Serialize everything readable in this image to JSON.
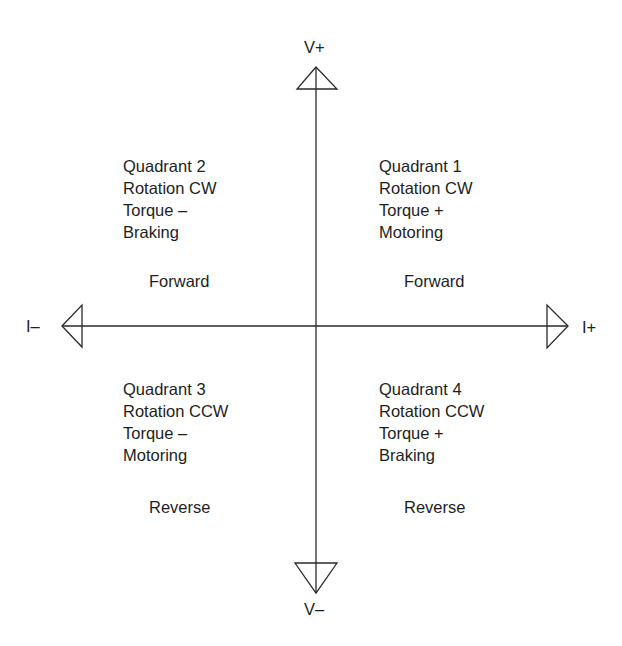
{
  "axes": {
    "vertical_positive": "V+",
    "vertical_negative": "V–",
    "horizontal_negative": "I–",
    "horizontal_positive": "I+"
  },
  "quadrants": [
    {
      "id": 1,
      "lines": [
        "Quadrant 1",
        "Rotation CW",
        "Torque +",
        "Motoring"
      ],
      "direction": "Forward"
    },
    {
      "id": 2,
      "lines": [
        "Quadrant 2",
        "Rotation CW",
        "Torque –",
        "Braking"
      ],
      "direction": "Forward"
    },
    {
      "id": 3,
      "lines": [
        "Quadrant 3",
        "Rotation CCW",
        "Torque –",
        "Motoring"
      ],
      "direction": "Reverse"
    },
    {
      "id": 4,
      "lines": [
        "Quadrant 4",
        "Rotation CCW",
        "Torque +",
        "Braking"
      ],
      "direction": "Reverse"
    }
  ],
  "icons": {
    "up": "arrowhead-up-icon",
    "down": "arrowhead-down-icon",
    "left": "arrowhead-left-icon",
    "right": "arrowhead-right-icon"
  }
}
